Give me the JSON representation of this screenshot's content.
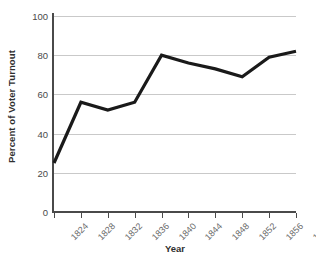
{
  "chart_data": {
    "type": "line",
    "title": "",
    "xlabel": "Year",
    "ylabel": "Percent of Voter Turnout",
    "x": [
      1824,
      1828,
      1832,
      1836,
      1840,
      1844,
      1848,
      1852,
      1856,
      1860
    ],
    "categories": [
      "1824",
      "1828",
      "1832",
      "1836",
      "1840",
      "1844",
      "1848",
      "1852",
      "1856",
      "1860"
    ],
    "values": [
      25,
      56,
      52,
      56,
      80,
      76,
      73,
      69,
      79,
      82
    ],
    "series": [
      {
        "name": "Percent of Voter Turnout",
        "values": [
          25,
          56,
          52,
          56,
          80,
          76,
          73,
          69,
          79,
          82
        ]
      }
    ],
    "ylim": [
      0,
      100
    ],
    "xlim": [
      1824,
      1860
    ],
    "y_ticks": [
      0,
      20,
      40,
      60,
      80,
      100
    ],
    "y_tick_labels": [
      "0",
      "20",
      "40",
      "60",
      "80",
      "100"
    ],
    "x_ticks": [
      1824,
      1828,
      1832,
      1836,
      1840,
      1844,
      1848,
      1852,
      1856,
      1860
    ],
    "x_tick_labels": [
      "1824",
      "1828",
      "1832",
      "1836",
      "1840",
      "1844",
      "1848",
      "1852",
      "1856",
      "1860"
    ],
    "grid": "horizontal",
    "legend": "none",
    "line_color": "#1a1a1a",
    "grid_color": "#c9c9c9",
    "axis_color": "#4a4a4a",
    "background_color": "#ffffff"
  }
}
